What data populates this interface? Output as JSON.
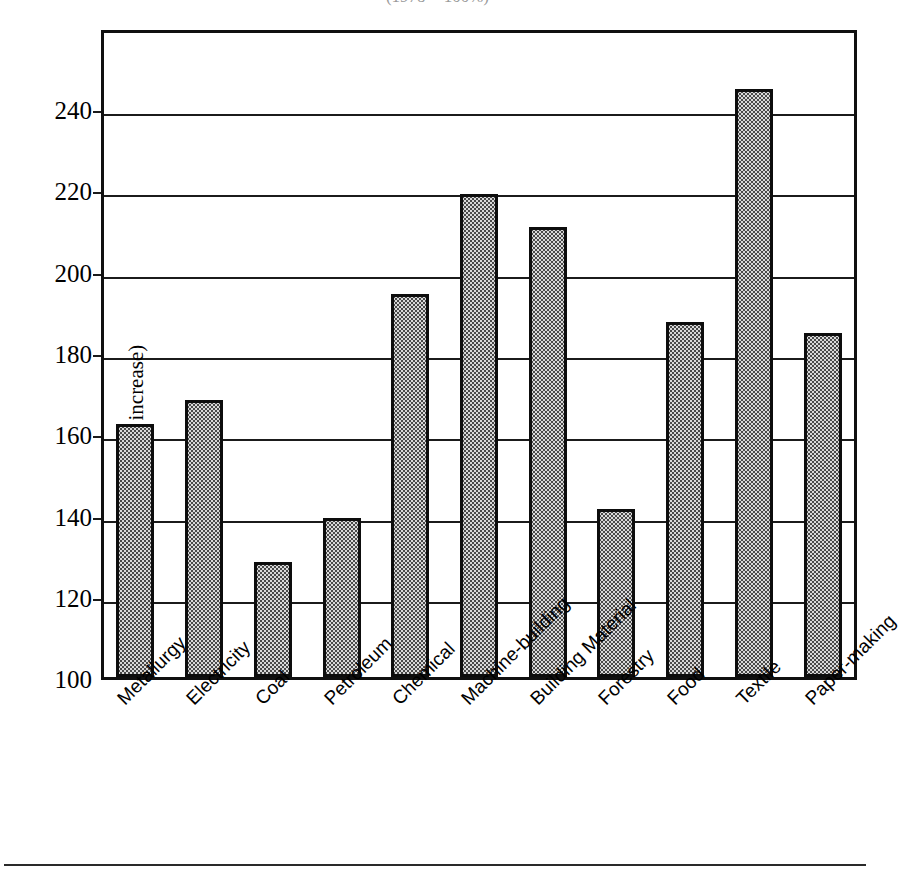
{
  "chart_data": {
    "type": "bar",
    "title": "(1978 = 100%)",
    "xlabel": "",
    "ylabel": "(% increase)",
    "ylim": [
      100,
      250
    ],
    "yticks": [
      100,
      120,
      140,
      160,
      180,
      200,
      220,
      240
    ],
    "grid": true,
    "legend": "none",
    "categories": [
      "Metallurgy",
      "Electricity",
      "Coal",
      "Petroleum",
      "Chemical",
      "Machine-building",
      "Building Material",
      "Forestry",
      "Food",
      "Textile",
      "Paper-making"
    ],
    "values": [
      161.5,
      167.5,
      127.5,
      138.5,
      193.5,
      218,
      210,
      140.5,
      186.5,
      244,
      184
    ],
    "bar_fill_color": "#d9d9d9",
    "bar_edge_color": "#0d0d0d",
    "axis_color": "#1b1b1b",
    "background_color": "#ffffff"
  },
  "axis": {
    "y_title": "(% increase)",
    "y_tick_labels": [
      "240",
      "220",
      "200",
      "180",
      "160",
      "140",
      "120",
      "100"
    ]
  }
}
